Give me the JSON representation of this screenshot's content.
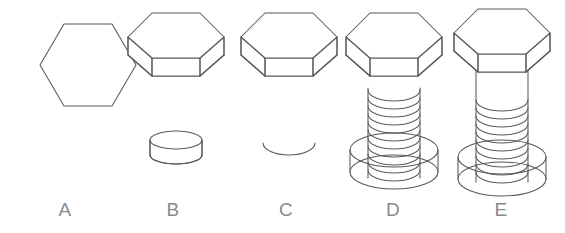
{
  "figure": {
    "background_color": "#ffffff",
    "line_color": "#585858",
    "label_color": "#8a8a8a",
    "stage_count": 5
  },
  "stages": [
    {
      "label": "A",
      "name": "flat-hexagon-outline",
      "description": "2D hexagon wireframe outline",
      "label_x": 52,
      "label_y": 200,
      "components": [
        "hexagon-face"
      ]
    },
    {
      "label": "B",
      "name": "hex-head-and-ring",
      "description": "Extruded hexagonal head with separate short cylinder ring below",
      "label_x": 160,
      "label_y": 200,
      "components": [
        "hex-head-prism",
        "cylinder-ring"
      ]
    },
    {
      "label": "C",
      "name": "hex-head-and-arc",
      "description": "Hexagonal head with single lower arc below",
      "label_x": 273,
      "label_y": 200,
      "components": [
        "hex-head-prism",
        "lower-arc"
      ]
    },
    {
      "label": "D",
      "name": "detached-head-threaded-shaft-collar",
      "description": "Hexagonal head separated above threaded shaft with wide collar",
      "label_x": 380,
      "label_y": 200,
      "components": [
        "hex-head-prism",
        "thread-helix",
        "wide-collar"
      ]
    },
    {
      "label": "E",
      "name": "assembled-hex-bolt",
      "description": "Complete assembled hex bolt with head, threaded shaft and collar",
      "label_x": 488,
      "label_y": 200,
      "components": [
        "hex-head-prism",
        "shaft",
        "thread-helix",
        "wide-collar"
      ]
    }
  ],
  "geometry": {
    "thread_coil_count_d": 11,
    "thread_coil_count_e": 11,
    "hexagon_orientation": "flat-top"
  }
}
